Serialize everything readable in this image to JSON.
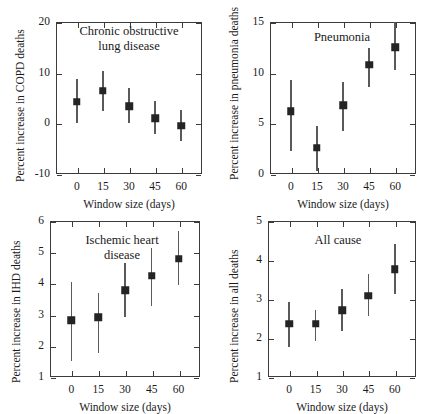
{
  "figure": {
    "name": "four-panel-error-bar-figure",
    "xlabel": "Window size (days)",
    "x_categories": [
      "0",
      "15",
      "30",
      "45",
      "60"
    ]
  },
  "chart_data": [
    {
      "id": "copd",
      "type": "scatter",
      "title": "",
      "annotation_lines": [
        "Chronic obstructive",
        "lung disease"
      ],
      "xlabel": "Window size (days)",
      "ylabel": "Percent increase in COPD deaths",
      "x": [
        0,
        15,
        30,
        45,
        60
      ],
      "xticklabels": [
        "0",
        "15",
        "30",
        "45",
        "60"
      ],
      "xlim": [
        -12,
        72
      ],
      "ylim": [
        -10,
        20
      ],
      "yticks": [
        -10,
        0,
        10,
        20
      ],
      "yticklabels": [
        "-10",
        "0",
        "10",
        "20"
      ],
      "grid": false,
      "legend": "none",
      "series": [
        {
          "name": "percent increase in COPD deaths",
          "values": [
            4.3,
            6.4,
            3.4,
            1.0,
            -0.5
          ],
          "err_low": [
            0.0,
            2.5,
            0.1,
            -2.2,
            -3.5
          ],
          "err_high": [
            8.7,
            10.4,
            7.0,
            4.4,
            2.6
          ]
        }
      ]
    },
    {
      "id": "pneumonia",
      "type": "scatter",
      "title": "",
      "annotation_lines": [
        "Pneumonia"
      ],
      "xlabel": "Window size (days)",
      "ylabel": "Percent increase in pneumonia deaths",
      "x": [
        0,
        15,
        30,
        45,
        60
      ],
      "xticklabels": [
        "0",
        "15",
        "30",
        "45",
        "60"
      ],
      "xlim": [
        -12,
        72
      ],
      "ylim": [
        0,
        15
      ],
      "yticks": [
        0,
        5,
        10,
        15
      ],
      "yticklabels": [
        "0",
        "5",
        "10",
        "15"
      ],
      "grid": false,
      "legend": "none",
      "series": [
        {
          "name": "percent increase in pneumonia deaths",
          "values": [
            6.2,
            2.6,
            6.8,
            10.8,
            12.5
          ],
          "err_low": [
            2.3,
            0.3,
            4.2,
            8.6,
            10.3
          ],
          "err_high": [
            9.3,
            4.7,
            9.1,
            12.4,
            15.0
          ]
        }
      ]
    },
    {
      "id": "ihd",
      "type": "scatter",
      "title": "",
      "annotation_lines": [
        "Ischemic heart",
        "disease"
      ],
      "xlabel": "Window size (days)",
      "ylabel": "Percent increase in IHD deaths",
      "x": [
        0,
        15,
        30,
        45,
        60
      ],
      "xticklabels": [
        "0",
        "15",
        "30",
        "45",
        "60"
      ],
      "xlim": [
        -12,
        72
      ],
      "ylim": [
        1,
        6
      ],
      "yticks": [
        1,
        2,
        3,
        4,
        5,
        6
      ],
      "yticklabels": [
        "1",
        "2",
        "3",
        "4",
        "5",
        "6"
      ],
      "grid": false,
      "legend": "none",
      "series": [
        {
          "name": "percent increase in IHD deaths",
          "values": [
            2.82,
            2.91,
            3.78,
            4.24,
            4.79
          ],
          "err_low": [
            1.52,
            1.78,
            2.91,
            3.28,
            3.96
          ],
          "err_high": [
            4.06,
            3.7,
            4.66,
            5.15,
            5.68
          ]
        }
      ]
    },
    {
      "id": "allcause",
      "type": "scatter",
      "title": "",
      "annotation_lines": [
        "All cause"
      ],
      "xlabel": "Window size (days)",
      "ylabel": "Percent increase in all deaths",
      "x": [
        0,
        15,
        30,
        45,
        60
      ],
      "xticklabels": [
        "0",
        "15",
        "30",
        "45",
        "60"
      ],
      "xlim": [
        -12,
        72
      ],
      "ylim": [
        1,
        5
      ],
      "yticks": [
        1,
        2,
        3,
        4,
        5
      ],
      "yticklabels": [
        "1",
        "2",
        "3",
        "4",
        "5"
      ],
      "grid": false,
      "legend": "none",
      "series": [
        {
          "name": "percent increase in all deaths",
          "values": [
            2.37,
            2.37,
            2.71,
            3.08,
            3.76
          ],
          "err_low": [
            1.78,
            1.92,
            2.18,
            2.57,
            3.12
          ],
          "err_high": [
            2.93,
            2.73,
            3.26,
            3.63,
            4.41
          ]
        }
      ]
    }
  ],
  "colors": {
    "marker": "#242424",
    "errorbar": "#5a5a5a",
    "axis": "#3b3b3b",
    "text": "#1a1a1a",
    "background": "#ffffff"
  }
}
